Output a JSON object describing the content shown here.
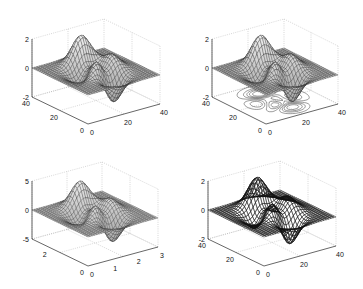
{
  "figure": {
    "title": "",
    "layout": "2x2 subplots of 3-D surface plots"
  },
  "chart_data": [
    {
      "type": "surface",
      "panel": "top-left",
      "style": "mesh (surf) with gray faces",
      "title": "",
      "xlabel": "",
      "ylabel": "",
      "zlabel": "",
      "xlim": [
        0,
        40
      ],
      "ylim": [
        0,
        40
      ],
      "zlim": [
        -2,
        2
      ],
      "x_ticks": [
        "0",
        "20",
        "40"
      ],
      "y_ticks": [
        "0",
        "20",
        "40"
      ],
      "z_ticks": [
        "-2",
        "0",
        "2"
      ],
      "grid": true
    },
    {
      "type": "surface",
      "panel": "top-right",
      "style": "surface with contour plot on base (surfc)",
      "title": "",
      "xlim": [
        0,
        40
      ],
      "ylim": [
        0,
        40
      ],
      "zlim": [
        -2,
        2
      ],
      "x_ticks": [
        "0",
        "20",
        "40"
      ],
      "y_ticks": [
        "0",
        "20",
        "40"
      ],
      "z_ticks": [
        "-2",
        "0",
        "2"
      ],
      "grid": true
    },
    {
      "type": "surface",
      "panel": "bottom-left",
      "style": "mesh surface",
      "title": "",
      "xlim": [
        0,
        3
      ],
      "ylim": [
        0,
        3
      ],
      "zlim": [
        -5,
        5
      ],
      "x_ticks": [
        "0",
        "1",
        "2",
        "3"
      ],
      "y_ticks": [
        "0",
        "2"
      ],
      "z_ticks": [
        "-5",
        "0",
        "5"
      ],
      "grid": true
    },
    {
      "type": "surface",
      "panel": "bottom-right",
      "style": "wireframe mesh (dark, transparent)",
      "title": "",
      "xlim": [
        0,
        40
      ],
      "ylim": [
        0,
        40
      ],
      "zlim": [
        -2,
        2
      ],
      "x_ticks": [
        "0",
        "20",
        "40"
      ],
      "y_ticks": [
        "0",
        "20",
        "40"
      ],
      "z_ticks": [
        "-2",
        "0",
        "2"
      ],
      "grid": true
    }
  ],
  "panels": [
    {
      "id": "tl",
      "geom": {
        "ox": 88,
        "oy": 124,
        "ax": [
          72,
          -20
        ],
        "ay": [
          -56,
          -27
        ],
        "zb": 124,
        "zh": 58,
        "zmin": -2,
        "zmax": 2
      },
      "xt": [
        {
          "t": "0",
          "f": 0
        },
        {
          "t": "20",
          "f": 0.5
        },
        {
          "t": "40",
          "f": 1
        }
      ],
      "yt": [
        {
          "t": "0",
          "f": 0
        },
        {
          "t": "20",
          "f": 0.5
        },
        {
          "t": "40",
          "f": 1
        }
      ],
      "zt": [
        {
          "t": "2",
          "f": 1
        },
        {
          "t": "0",
          "f": 0.5
        },
        {
          "t": "-2",
          "f": 0
        }
      ],
      "mode": "surf",
      "fill": "#d8d8d8",
      "stroke": "#222",
      "contour": false,
      "scale": 1
    },
    {
      "id": "tr",
      "geom": {
        "ox": 266,
        "oy": 124,
        "ax": [
          72,
          -20
        ],
        "ay": [
          -54,
          -27
        ],
        "zb": 124,
        "zh": 58,
        "zmin": -2,
        "zmax": 2
      },
      "xt": [
        {
          "t": "0",
          "f": 0
        },
        {
          "t": "20",
          "f": 0.5
        },
        {
          "t": "40",
          "f": 1
        }
      ],
      "yt": [
        {
          "t": "0",
          "f": 0
        },
        {
          "t": "20",
          "f": 0.5
        },
        {
          "t": "40",
          "f": 1
        }
      ],
      "zt": [
        {
          "t": "2",
          "f": 1
        },
        {
          "t": "0",
          "f": 0.5
        },
        {
          "t": "-2",
          "f": 0
        }
      ],
      "mode": "surf",
      "fill": "#d8d8d8",
      "stroke": "#222",
      "contour": true,
      "scale": 1
    },
    {
      "id": "bl",
      "geom": {
        "ox": 88,
        "oy": 266,
        "ax": [
          70,
          -19
        ],
        "ay": [
          -56,
          -27
        ],
        "zb": 266,
        "zh": 58,
        "zmin": -5,
        "zmax": 5
      },
      "xt": [
        {
          "t": "0",
          "f": 0
        },
        {
          "t": "1",
          "f": 0.333
        },
        {
          "t": "2",
          "f": 0.667
        },
        {
          "t": "3",
          "f": 1
        }
      ],
      "yt": [
        {
          "t": "0",
          "f": 0
        },
        {
          "t": "2",
          "f": 0.667
        }
      ],
      "zt": [
        {
          "t": "5",
          "f": 1
        },
        {
          "t": "0",
          "f": 0.5
        },
        {
          "t": "-5",
          "f": 0
        }
      ],
      "mode": "surf",
      "fill": "#cfcfcf",
      "stroke": "#333",
      "contour": false,
      "scale": 0.55
    },
    {
      "id": "br",
      "geom": {
        "ox": 264,
        "oy": 266,
        "ax": [
          72,
          -20
        ],
        "ay": [
          -56,
          -27
        ],
        "zb": 266,
        "zh": 58,
        "zmin": -2,
        "zmax": 2
      },
      "xt": [
        {
          "t": "0",
          "f": 0
        },
        {
          "t": "20",
          "f": 0.5
        },
        {
          "t": "40",
          "f": 1
        }
      ],
      "yt": [
        {
          "t": "0",
          "f": 0
        },
        {
          "t": "20",
          "f": 0.5
        },
        {
          "t": "40",
          "f": 1
        }
      ],
      "zt": [
        {
          "t": "2",
          "f": 1
        },
        {
          "t": "0",
          "f": 0.5
        },
        {
          "t": "-2",
          "f": 0
        }
      ],
      "mode": "mesh",
      "fill": "none",
      "stroke": "#111",
      "contour": false,
      "scale": 1
    }
  ]
}
